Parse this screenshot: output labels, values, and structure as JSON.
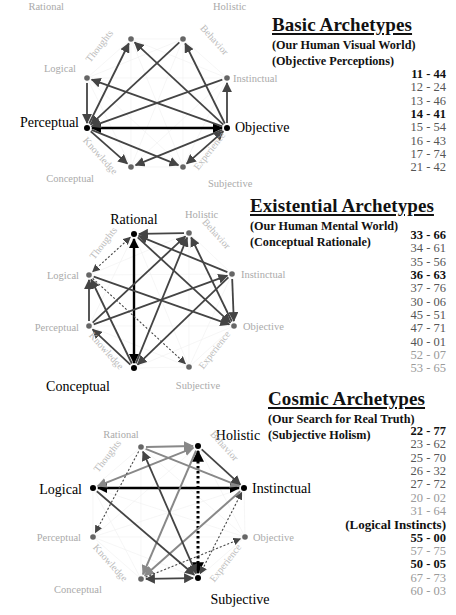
{
  "sections": [
    {
      "id": "basic",
      "title": "Basic Archetypes",
      "subtitles": [
        "(Our Human Visual World)",
        "(Objective Perceptions)"
      ],
      "codes": [
        {
          "text": "11 - 44",
          "style": "bold"
        },
        {
          "text": "12 - 24",
          "style": "mid"
        },
        {
          "text": "13 - 46",
          "style": "mid"
        },
        {
          "text": "14 - 41",
          "style": "bold"
        },
        {
          "text": "15 - 54",
          "style": "mid"
        },
        {
          "text": "16 - 43",
          "style": "mid"
        },
        {
          "text": "17 - 74",
          "style": "mid"
        },
        {
          "text": "21 - 42",
          "style": "mid"
        }
      ]
    },
    {
      "id": "existential",
      "title": "Existential Archetypes",
      "subtitles": [
        "(Our Human Mental World)",
        "(Conceptual Rationale)"
      ],
      "codes": [
        {
          "text": "33 - 66",
          "style": "bold"
        },
        {
          "text": "34 - 61",
          "style": "mid"
        },
        {
          "text": "35 - 56",
          "style": "mid"
        },
        {
          "text": "36 - 63",
          "style": "bold"
        },
        {
          "text": "37 - 76",
          "style": "mid"
        },
        {
          "text": "30 - 06",
          "style": "mid"
        },
        {
          "text": "45 - 51",
          "style": "mid"
        },
        {
          "text": "47 - 71",
          "style": "mid"
        },
        {
          "text": "40 - 01",
          "style": "mid"
        },
        {
          "text": "52 - 07",
          "style": "light"
        },
        {
          "text": "53 - 65",
          "style": "light"
        }
      ]
    },
    {
      "id": "cosmic",
      "title": "Cosmic Archetypes",
      "subtitles": [
        "(Our Search for Real Truth)",
        "(Subjective Holism)"
      ],
      "codes": [
        {
          "text": "22 - 77",
          "style": "bold"
        },
        {
          "text": "23 - 62",
          "style": "mid"
        },
        {
          "text": "25 - 70",
          "style": "mid"
        },
        {
          "text": "26 - 32",
          "style": "mid"
        },
        {
          "text": "27 - 72",
          "style": "mid"
        },
        {
          "text": "20 - 02",
          "style": "light"
        },
        {
          "text": "31 - 64",
          "style": "light"
        }
      ],
      "extra_heading": "(Logical Instincts)",
      "extra_codes": [
        {
          "text": "55 - 00",
          "style": "bold"
        },
        {
          "text": "57 - 75",
          "style": "light"
        },
        {
          "text": "50 - 05",
          "style": "bold"
        },
        {
          "text": "67 - 73",
          "style": "light"
        },
        {
          "text": "60 - 03",
          "style": "light"
        }
      ]
    }
  ],
  "diagrams": [
    {
      "id": "basic-diagram",
      "nodes": {
        "Rational": {
          "x": 131,
          "y": 39,
          "active": false,
          "label": "Rational",
          "lx": 64,
          "ly": 10,
          "anchor": "end"
        },
        "Holistic": {
          "x": 183,
          "y": 39,
          "active": false,
          "label": "Holistic",
          "lx": 213,
          "ly": 10,
          "anchor": "start"
        },
        "Instinctual": {
          "x": 227,
          "y": 78,
          "active": false,
          "label": "Instinctual",
          "lx": 233,
          "ly": 82,
          "anchor": "start"
        },
        "Objective": {
          "x": 227,
          "y": 128,
          "active": true,
          "label": "Objective",
          "lx": 235,
          "ly": 132,
          "anchor": "start"
        },
        "Subjective": {
          "x": 183,
          "y": 167,
          "active": false,
          "label": "Subjective",
          "lx": 208,
          "ly": 187,
          "anchor": "start"
        },
        "Conceptual": {
          "x": 131,
          "y": 167,
          "active": false,
          "label": "Conceptual",
          "lx": 94,
          "ly": 182,
          "anchor": "end"
        },
        "Perceptual": {
          "x": 87,
          "y": 128,
          "active": true,
          "label": "Perceptual",
          "lx": 79,
          "ly": 127,
          "anchor": "end"
        },
        "Logical": {
          "x": 87,
          "y": 78,
          "active": false,
          "label": "Logical",
          "lx": 76,
          "ly": 72,
          "anchor": "end"
        }
      },
      "arc_labels": [
        {
          "text": "Thoughts",
          "x": 102,
          "y": 48,
          "rot": -52
        },
        {
          "text": "Behavior",
          "x": 212,
          "y": 42,
          "rot": 48
        },
        {
          "text": "Knowledge",
          "x": 98,
          "y": 158,
          "rot": 48
        },
        {
          "text": "Experience",
          "x": 212,
          "y": 153,
          "rot": -52
        }
      ],
      "edges": [
        {
          "from": "Objective",
          "to": "Perceptual",
          "style": "bold",
          "both": true
        },
        {
          "from": "Logical",
          "to": "Perceptual",
          "style": "dark"
        },
        {
          "from": "Perceptual",
          "to": "Rational",
          "style": "dark"
        },
        {
          "from": "Holistic",
          "to": "Perceptual",
          "style": "dark"
        },
        {
          "from": "Instinctual",
          "to": "Perceptual",
          "style": "dark"
        },
        {
          "from": "Perceptual",
          "to": "Conceptual",
          "style": "dark"
        },
        {
          "from": "Perceptual",
          "to": "Subjective",
          "style": "dark"
        },
        {
          "from": "Objective",
          "to": "Rational",
          "style": "dark"
        },
        {
          "from": "Objective",
          "to": "Holistic",
          "style": "dark"
        },
        {
          "from": "Objective",
          "to": "Instinctual",
          "style": "dark"
        },
        {
          "from": "Objective",
          "to": "Logical",
          "style": "dark"
        },
        {
          "from": "Objective",
          "to": "Conceptual",
          "style": "dark"
        },
        {
          "from": "Objective",
          "to": "Subjective",
          "style": "dark",
          "both": true
        }
      ]
    },
    {
      "id": "existential-diagram",
      "nodes": {
        "Rational": {
          "x": 134,
          "y": 234,
          "active": true,
          "label": "Rational",
          "lx": 134,
          "ly": 224,
          "anchor": "middle"
        },
        "Holistic": {
          "x": 189,
          "y": 233,
          "active": false,
          "label": "Holistic",
          "lx": 185,
          "ly": 218,
          "anchor": "start"
        },
        "Instinctual": {
          "x": 232,
          "y": 274,
          "active": false,
          "label": "Instinctual",
          "lx": 241,
          "ly": 278,
          "anchor": "start"
        },
        "Objective": {
          "x": 234,
          "y": 326,
          "active": false,
          "label": "Objective",
          "lx": 243,
          "ly": 330,
          "anchor": "start"
        },
        "Subjective": {
          "x": 189,
          "y": 367,
          "active": false,
          "label": "Subjective",
          "lx": 198,
          "ly": 389,
          "anchor": "middle"
        },
        "Conceptual": {
          "x": 134,
          "y": 368,
          "active": true,
          "label": "Conceptual",
          "lx": 78,
          "ly": 391,
          "anchor": "middle"
        },
        "Perceptual": {
          "x": 89,
          "y": 326,
          "active": false,
          "label": "Perceptual",
          "lx": 79,
          "ly": 331,
          "anchor": "end"
        },
        "Logical": {
          "x": 89,
          "y": 275,
          "active": false,
          "label": "Logical",
          "lx": 79,
          "ly": 279,
          "anchor": "end"
        }
      },
      "arc_labels": [
        {
          "text": "Thoughts",
          "x": 106,
          "y": 245,
          "rot": -52
        },
        {
          "text": "Behavior",
          "x": 214,
          "y": 236,
          "rot": 48
        },
        {
          "text": "Knowledge",
          "x": 104,
          "y": 353,
          "rot": 48
        },
        {
          "text": "Experience",
          "x": 217,
          "y": 352,
          "rot": -52
        }
      ],
      "edges": [
        {
          "from": "Rational",
          "to": "Conceptual",
          "style": "bold",
          "both": true
        },
        {
          "from": "Rational",
          "to": "Logical",
          "style": "dotted",
          "both": true
        },
        {
          "from": "Holistic",
          "to": "Rational",
          "style": "dark"
        },
        {
          "from": "Instinctual",
          "to": "Rational",
          "style": "dark"
        },
        {
          "from": "Rational",
          "to": "Objective",
          "style": "dark"
        },
        {
          "from": "Perceptual",
          "to": "Holistic",
          "style": "dark"
        },
        {
          "from": "Conceptual",
          "to": "Holistic",
          "style": "dark"
        },
        {
          "from": "Objective",
          "to": "Holistic",
          "style": "dark"
        },
        {
          "from": "Instinctual",
          "to": "Objective",
          "style": "dark"
        },
        {
          "from": "Logical",
          "to": "Objective",
          "style": "dark"
        },
        {
          "from": "Perceptual",
          "to": "Instinctual",
          "style": "dark"
        },
        {
          "from": "Instinctual",
          "to": "Conceptual",
          "style": "dark"
        },
        {
          "from": "Perceptual",
          "to": "Logical",
          "style": "dark"
        },
        {
          "from": "Conceptual",
          "to": "Logical",
          "style": "dark"
        },
        {
          "from": "Conceptual",
          "to": "Perceptual",
          "style": "dark"
        },
        {
          "from": "Logical",
          "to": "Subjective",
          "style": "dotted"
        }
      ]
    },
    {
      "id": "cosmic-diagram",
      "nodes": {
        "Rational": {
          "x": 141,
          "y": 447,
          "active": false,
          "label": "Rational",
          "lx": 121,
          "ly": 438,
          "anchor": "middle"
        },
        "Holistic": {
          "x": 198,
          "y": 446,
          "active": true,
          "label": "Holistic",
          "lx": 238,
          "ly": 440,
          "anchor": "middle"
        },
        "Instinctual": {
          "x": 244,
          "y": 488,
          "active": true,
          "label": "Instinctual",
          "lx": 252,
          "ly": 493,
          "anchor": "start"
        },
        "Objective": {
          "x": 245,
          "y": 537,
          "active": false,
          "label": "Objective",
          "lx": 253,
          "ly": 541,
          "anchor": "start"
        },
        "Subjective": {
          "x": 198,
          "y": 578,
          "active": true,
          "label": "Subjective",
          "lx": 240,
          "ly": 604,
          "anchor": "middle"
        },
        "Conceptual": {
          "x": 141,
          "y": 579,
          "active": false,
          "label": "Conceptual",
          "lx": 78,
          "ly": 593,
          "anchor": "middle"
        },
        "Perceptual": {
          "x": 93,
          "y": 537,
          "active": false,
          "label": "Perceptual",
          "lx": 81,
          "ly": 541,
          "anchor": "end"
        },
        "Logical": {
          "x": 93,
          "y": 488,
          "active": true,
          "label": "Logical",
          "lx": 82,
          "ly": 494,
          "anchor": "end"
        }
      },
      "arc_labels": [
        {
          "text": "Thoughts",
          "x": 110,
          "y": 458,
          "rot": -52
        },
        {
          "text": "Behavior",
          "x": 222,
          "y": 448,
          "rot": 48
        },
        {
          "text": "Knowledge",
          "x": 108,
          "y": 565,
          "rot": 48
        },
        {
          "text": "Experience",
          "x": 228,
          "y": 565,
          "rot": -52
        }
      ],
      "edges": [
        {
          "from": "Logical",
          "to": "Instinctual",
          "style": "bold",
          "both": true
        },
        {
          "from": "Holistic",
          "to": "Subjective",
          "style": "bolddot",
          "both": true
        },
        {
          "from": "Rational",
          "to": "Holistic",
          "style": "light"
        },
        {
          "from": "Holistic",
          "to": "Logical",
          "style": "light",
          "both": true
        },
        {
          "from": "Rational",
          "to": "Instinctual",
          "style": "light"
        },
        {
          "from": "Holistic",
          "to": "Instinctual",
          "style": "dark"
        },
        {
          "from": "Holistic",
          "to": "Conceptual",
          "style": "light"
        },
        {
          "from": "Instinctual",
          "to": "Conceptual",
          "style": "light"
        },
        {
          "from": "Subjective",
          "to": "Rational",
          "style": "dark",
          "both": true
        },
        {
          "from": "Logical",
          "to": "Subjective",
          "style": "dark"
        },
        {
          "from": "Conceptual",
          "to": "Subjective",
          "style": "dark",
          "both": true
        },
        {
          "from": "Rational",
          "to": "Perceptual",
          "style": "dotted"
        },
        {
          "from": "Conceptual",
          "to": "Objective",
          "style": "dotted"
        },
        {
          "from": "Subjective",
          "to": "Instinctual",
          "style": "dotted",
          "both": true
        }
      ]
    }
  ]
}
